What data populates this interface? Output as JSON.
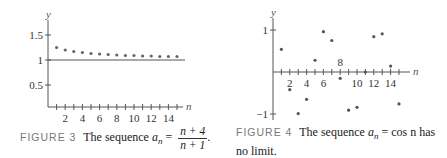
{
  "figures": [
    {
      "id": "figure-3",
      "caption": {
        "tag": "FIGURE 3",
        "text": "The sequence",
        "seq_symbol": "a",
        "seq_sub": "n",
        "equals": "=",
        "numerator": "n + 4",
        "denominator": "n + 1",
        "trailing": "."
      },
      "y_axis_label": "y",
      "x_axis_label": "n",
      "y_ticks": [
        "1.5",
        "1",
        "0.5"
      ],
      "x_ticks": [
        "2",
        "4",
        "6",
        "8",
        "10",
        "12",
        "14"
      ]
    },
    {
      "id": "figure-4",
      "caption": {
        "tag": "FIGURE 4",
        "text": "The sequence",
        "seq_symbol": "a",
        "seq_sub": "n",
        "rest": "= cos n has",
        "line2": "no limit."
      },
      "y_axis_label": "y",
      "x_axis_label": "n",
      "y_ticks": [
        "1",
        "−1"
      ],
      "x_ticks": [
        "2",
        "4",
        "6",
        "8",
        "10",
        "12",
        "14"
      ]
    }
  ],
  "chart_data": [
    {
      "type": "scatter",
      "title": "FIGURE 3 The sequence a_n = (n+4)/(n+1).",
      "xlabel": "n",
      "ylabel": "y",
      "x": [
        1,
        2,
        3,
        4,
        5,
        6,
        7,
        8,
        9,
        10,
        11,
        12,
        13,
        14,
        15
      ],
      "y": [
        2.5,
        2.0,
        1.75,
        1.6,
        1.5,
        1.43,
        1.375,
        1.33,
        1.3,
        1.27,
        1.25,
        1.23,
        1.21,
        1.2,
        1.19
      ],
      "plotted_y_note": "points rendered near 1.25 decreasing toward 1",
      "rendered_y": [
        1.25,
        1.2,
        1.17,
        1.15,
        1.13,
        1.12,
        1.11,
        1.1,
        1.09,
        1.09,
        1.08,
        1.08,
        1.07,
        1.07,
        1.07
      ],
      "asymptote": 1,
      "xlim": [
        0,
        16
      ],
      "ylim": [
        0,
        1.7
      ],
      "x_tick_labels": [
        "2",
        "4",
        "6",
        "8",
        "10",
        "12",
        "14"
      ],
      "y_tick_labels": [
        "0.5",
        "1",
        "1.5"
      ],
      "grid": false,
      "legend": null
    },
    {
      "type": "scatter",
      "title": "FIGURE 4 The sequence a_n = cos n has no limit.",
      "xlabel": "n",
      "ylabel": "y",
      "x": [
        1,
        2,
        3,
        4,
        5,
        6,
        7,
        8,
        9,
        10,
        11,
        12,
        13,
        14,
        15
      ],
      "y": [
        0.54,
        -0.42,
        -0.99,
        -0.65,
        0.28,
        0.96,
        0.75,
        -0.15,
        -0.91,
        -0.84,
        0.0,
        0.84,
        0.91,
        0.14,
        -0.76
      ],
      "xlim": [
        0,
        16
      ],
      "ylim": [
        -1.1,
        1.2
      ],
      "x_tick_labels": [
        "2",
        "4",
        "6",
        "8",
        "10",
        "12",
        "14"
      ],
      "y_tick_labels": [
        "-1",
        "1"
      ],
      "grid": false,
      "legend": null
    }
  ]
}
